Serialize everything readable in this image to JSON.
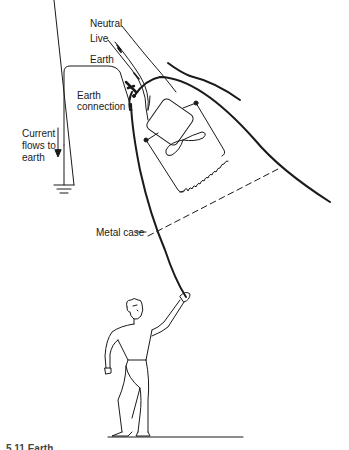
{
  "diagram": {
    "type": "earthing-safety-illustration",
    "labels": {
      "neutral": "Neutral",
      "live": "Live",
      "earth": "Earth",
      "earth_connection_line1": "Earth",
      "earth_connection_line2": "connection",
      "current_line1": "Current",
      "current_line2": "flows to",
      "current_line3": "earth",
      "metal_case": "Metal case"
    },
    "caption_partial": "5.11  Earth..."
  }
}
